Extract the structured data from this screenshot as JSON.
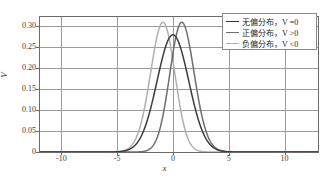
{
  "chart_data": {
    "type": "line",
    "title": "",
    "xlabel": "x",
    "ylabel": "V",
    "xlim": [
      -12,
      13
    ],
    "ylim": [
      0,
      0.325
    ],
    "grid": true,
    "legend_position": "upper right",
    "xticks": [
      -10,
      -5,
      0,
      5,
      10
    ],
    "xtick_labels": [
      "-10",
      "-5",
      "0",
      "5",
      "10"
    ],
    "yticks": [
      0,
      0.05,
      0.1,
      0.15,
      0.2,
      0.25,
      0.3
    ],
    "ytick_labels": [
      "0",
      "0.05",
      "0.10",
      "0.15",
      "0.20",
      "0.25",
      "0.30"
    ],
    "series": [
      {
        "name": "无偏分布，V =0",
        "label_cn": "无偏分布",
        "label_cond": "V =0",
        "color": "#3c3c3c",
        "peak_x": 0.0,
        "peak_y": 0.28,
        "sigma": 1.42,
        "skew": 0.0
      },
      {
        "name": "正偏分布，V >0",
        "label_cn": "正偏分布",
        "label_cond": "V >0",
        "color": "#6e6e6e",
        "peak_x": 0.8,
        "peak_y": 0.31,
        "sigma": 1.3,
        "skew": 0.9
      },
      {
        "name": "负偏分布，V <0",
        "label_cn": "负偏分布",
        "label_cond": "V <0",
        "color": "#b0b0b0",
        "peak_x": -0.9,
        "peak_y": 0.31,
        "sigma": 1.3,
        "skew": -0.9
      }
    ]
  },
  "legend": {
    "items": [
      {
        "text": "无偏分布，V =0"
      },
      {
        "text": "正偏分布，V >0"
      },
      {
        "text": "负偏分布，V <0"
      }
    ]
  },
  "axes": {
    "x_axis_label": "x",
    "y_axis_label": "V"
  },
  "colors": {
    "grid": "#9a9a9a",
    "frame": "#6a6a6a",
    "background": "#ffffff",
    "series_1": "#3c3c3c",
    "series_2": "#6e6e6e",
    "series_3": "#b0b0b0"
  }
}
